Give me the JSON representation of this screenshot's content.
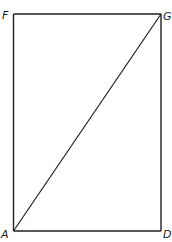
{
  "diagram": {
    "type": "rectangle-with-diagonal",
    "stroke_color": "#231f20",
    "background": "#ffffff",
    "vertices": {
      "F": {
        "label": "F",
        "x": 13.5,
        "y": 14
      },
      "G": {
        "label": "G",
        "x": 161,
        "y": 14
      },
      "A": {
        "label": "A",
        "x": 13.5,
        "y": 231
      },
      "D": {
        "label": "D",
        "x": 161,
        "y": 231
      }
    },
    "segments": [
      "FG",
      "GD",
      "DA",
      "AF",
      "AG"
    ]
  }
}
